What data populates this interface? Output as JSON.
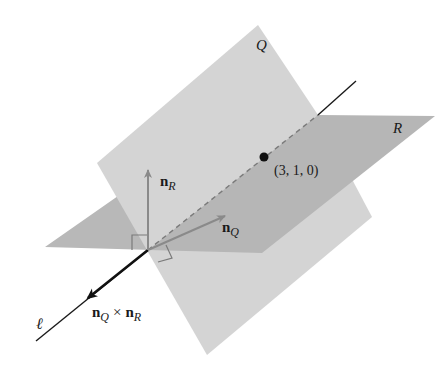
{
  "diagram": {
    "planes": [
      {
        "name": "Q",
        "label": "Q",
        "color": "#d4d4d4"
      },
      {
        "name": "R",
        "label": "R",
        "color": "#b8b8b8"
      }
    ],
    "line": {
      "label": "ℓ"
    },
    "point": {
      "label": "(3, 1, 0)"
    },
    "vectors": {
      "n_R": {
        "base": "n",
        "sub": "R"
      },
      "n_Q": {
        "base": "n",
        "sub": "Q"
      },
      "cross": {
        "base1": "n",
        "sub1": "Q",
        "op": "×",
        "base2": "n",
        "sub2": "R"
      }
    },
    "colors": {
      "plane_q": "#d4d4d4",
      "plane_r": "#b8b8b8",
      "overlap": "#c6c6c6",
      "normal_arrow": "#8a8a8a",
      "line": "#1a1a1a"
    }
  }
}
